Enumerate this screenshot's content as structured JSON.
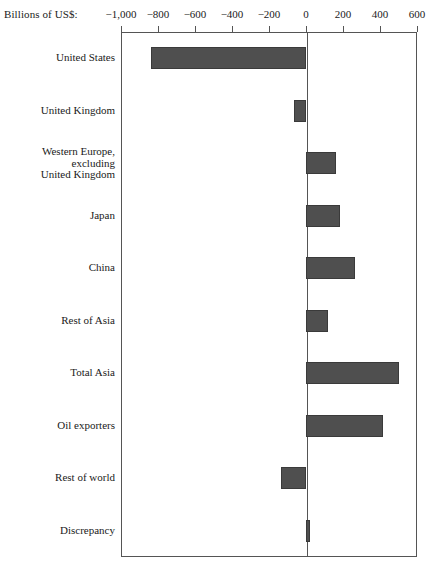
{
  "chart_data": {
    "type": "bar",
    "orientation": "horizontal",
    "title": "",
    "subtitle": "",
    "xlabel": "Billions of US$:",
    "ylabel": "",
    "xlim": [
      -1000,
      600
    ],
    "xticks": [
      -1000,
      -800,
      -600,
      -400,
      -200,
      0,
      200,
      400,
      600
    ],
    "xtick_labels": [
      "−1,000",
      "−800",
      "−600",
      "−400",
      "−200",
      "0",
      "200",
      "400",
      "600"
    ],
    "grid": false,
    "legend": null,
    "bar_color": "#4f4f4f",
    "axis_color": "#555555",
    "categories": [
      "United States",
      "United Kingdom",
      "Western Europe,\nexcluding\nUnited Kingdom",
      "Japan",
      "China",
      "Rest of Asia",
      "Total Asia",
      "Oil exporters",
      "Rest of world",
      "Discrepancy"
    ],
    "values": [
      -840,
      -65,
      160,
      185,
      265,
      120,
      500,
      415,
      -135,
      20
    ],
    "series": [
      {
        "name": "Current account balance",
        "values": [
          -840,
          -65,
          160,
          185,
          265,
          120,
          500,
          415,
          -135,
          20
        ]
      }
    ]
  }
}
